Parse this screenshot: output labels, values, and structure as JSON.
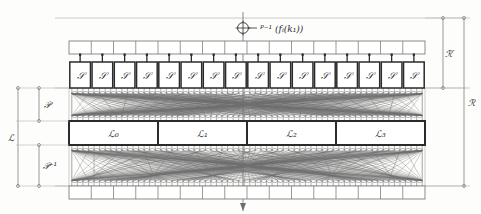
{
  "figure": {
    "type": "diagram",
    "width": 481,
    "height": 214,
    "background": "#fdfdfb",
    "ink": "#2b2b2b",
    "thin_ink": "#6e6e6e",
    "faint_ink": "#b5b5b5"
  },
  "annotations": {
    "top_marker_label": "ᴾ⁻¹ (fᵢ(k₁))",
    "top_marker_icon": "circle-plus-icon",
    "center_axis": "vertical-center-axis"
  },
  "brackets": {
    "right_inner": {
      "label": "ℛ′",
      "name": "bracket-R-prime"
    },
    "right_outer": {
      "label": "ℛ",
      "name": "bracket-R"
    },
    "left_outer": {
      "label": "ℒ",
      "name": "bracket-L"
    },
    "left_upper": {
      "label": "𝒫",
      "name": "bracket-P"
    },
    "left_lower": {
      "label": "𝒫⁻¹",
      "name": "bracket-P-inverse"
    }
  },
  "sbox_row": {
    "name": "sbox-row",
    "count": 16,
    "label": "𝒮",
    "labels": [
      "𝒮",
      "𝒮",
      "𝒮",
      "𝒮",
      "𝒮",
      "𝒮",
      "𝒮",
      "𝒮",
      "𝒮",
      "𝒮",
      "𝒮",
      "𝒮",
      "𝒮",
      "𝒮",
      "𝒮",
      "𝒮"
    ]
  },
  "top_strip": {
    "name": "top-register-strip",
    "cells": 16
  },
  "bottom_strip": {
    "name": "bottom-register-strip",
    "cells": 16
  },
  "l_row": {
    "name": "l-block-row",
    "blocks": [
      {
        "label": "ℒ₀"
      },
      {
        "label": "ℒ₁"
      },
      {
        "label": "ℒ₂"
      },
      {
        "label": "ℒ₃"
      }
    ]
  },
  "networks": {
    "upper": {
      "name": "upper-permutation-network",
      "wires": 64
    },
    "lower": {
      "name": "lower-permutation-network",
      "wires": 64
    }
  },
  "chart_data": {
    "type": "diagram",
    "nodes": {
      "sboxes": 16,
      "l_blocks": 4,
      "strip_cells_top": 16,
      "strip_cells_bottom": 16
    },
    "labels": [
      "𝒮",
      "ℒ₀",
      "ℒ₁",
      "ℒ₂",
      "ℒ₃",
      "𝒫",
      "𝒫⁻¹",
      "ℒ",
      "ℛ",
      "ℛ′"
    ]
  }
}
